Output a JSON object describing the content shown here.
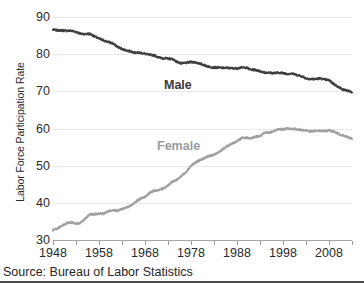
{
  "chart_data": {
    "type": "line",
    "title": "",
    "subtitle": "",
    "xlabel": "",
    "ylabel": "Labor Force Participation Rate",
    "xlim": [
      1948,
      2013
    ],
    "ylim": [
      30,
      90
    ],
    "grid": true,
    "grid_axis": "y",
    "legend_position": "inline-annotation",
    "y_ticks": [
      30,
      40,
      50,
      60,
      70,
      80,
      90
    ],
    "y_tick_labels": [
      "30",
      "40",
      "50",
      "60",
      "70",
      "80",
      "90"
    ],
    "x_ticks": [
      1948,
      1953,
      1958,
      1963,
      1968,
      1973,
      1978,
      1983,
      1988,
      1993,
      1998,
      2003,
      2008,
      2013
    ],
    "x_tick_labels_shown": [
      "1948",
      "1958",
      "1968",
      "1978",
      "1988",
      "1998",
      "2008"
    ],
    "x_tick_labels_values": [
      1948,
      1958,
      1968,
      1978,
      1988,
      1998,
      2008
    ],
    "annotations": [
      {
        "text": "Male",
        "x": 1975,
        "y": 74,
        "color": "#3a3a3a"
      },
      {
        "text": "Female",
        "x": 1973,
        "y": 55,
        "color": "#9b9b9b"
      }
    ],
    "series": [
      {
        "name": "Male",
        "color": "#3f3f3f",
        "x": [
          1948,
          1949,
          1950,
          1951,
          1952,
          1953,
          1954,
          1955,
          1956,
          1957,
          1958,
          1959,
          1960,
          1961,
          1962,
          1963,
          1964,
          1965,
          1966,
          1967,
          1968,
          1969,
          1970,
          1971,
          1972,
          1973,
          1974,
          1975,
          1976,
          1977,
          1978,
          1979,
          1980,
          1981,
          1982,
          1983,
          1984,
          1985,
          1986,
          1987,
          1988,
          1989,
          1990,
          1991,
          1992,
          1993,
          1994,
          1995,
          1996,
          1997,
          1998,
          1999,
          2000,
          2001,
          2002,
          2003,
          2004,
          2005,
          2006,
          2007,
          2008,
          2009,
          2010,
          2011,
          2012,
          2013
        ],
        "values": [
          86.6,
          86.4,
          86.4,
          86.3,
          86.3,
          86.0,
          85.5,
          85.4,
          85.5,
          84.8,
          84.2,
          83.7,
          83.3,
          82.9,
          82.0,
          81.4,
          81.0,
          80.7,
          80.4,
          80.4,
          80.1,
          79.8,
          79.7,
          79.1,
          78.9,
          78.8,
          78.7,
          77.9,
          77.5,
          77.7,
          77.9,
          77.8,
          77.4,
          77.0,
          76.6,
          76.4,
          76.4,
          76.3,
          76.3,
          76.2,
          76.2,
          76.4,
          76.4,
          75.8,
          75.8,
          75.4,
          75.1,
          75.0,
          74.9,
          75.0,
          74.9,
          74.7,
          74.8,
          74.4,
          74.1,
          73.5,
          73.3,
          73.3,
          73.5,
          73.2,
          73.0,
          72.0,
          71.2,
          70.5,
          70.2,
          69.7
        ]
      },
      {
        "name": "Female",
        "color": "#a0a0a0",
        "x": [
          1948,
          1949,
          1950,
          1951,
          1952,
          1953,
          1954,
          1955,
          1956,
          1957,
          1958,
          1959,
          1960,
          1961,
          1962,
          1963,
          1964,
          1965,
          1966,
          1967,
          1968,
          1969,
          1970,
          1971,
          1972,
          1973,
          1974,
          1975,
          1976,
          1977,
          1978,
          1979,
          1980,
          1981,
          1982,
          1983,
          1984,
          1985,
          1986,
          1987,
          1988,
          1989,
          1990,
          1991,
          1992,
          1993,
          1994,
          1995,
          1996,
          1997,
          1998,
          1999,
          2000,
          2001,
          2002,
          2003,
          2004,
          2005,
          2006,
          2007,
          2008,
          2009,
          2010,
          2011,
          2012,
          2013
        ],
        "values": [
          32.7,
          33.1,
          33.9,
          34.6,
          34.7,
          34.4,
          34.6,
          35.7,
          36.9,
          36.9,
          37.1,
          37.1,
          37.7,
          38.1,
          37.9,
          38.3,
          38.7,
          39.3,
          40.3,
          41.1,
          41.6,
          42.7,
          43.3,
          43.4,
          43.9,
          44.7,
          45.7,
          46.3,
          47.3,
          48.4,
          50.0,
          50.9,
          51.5,
          52.1,
          52.6,
          52.9,
          53.6,
          54.5,
          55.3,
          56.0,
          56.6,
          57.4,
          57.5,
          57.4,
          57.8,
          57.9,
          58.8,
          58.9,
          59.3,
          59.8,
          59.8,
          60.0,
          59.9,
          59.8,
          59.6,
          59.5,
          59.2,
          59.3,
          59.4,
          59.3,
          59.5,
          59.2,
          58.6,
          58.1,
          57.7,
          57.2
        ]
      }
    ]
  },
  "footer": {
    "source": "Source: Bureau of Labor Statistics"
  }
}
